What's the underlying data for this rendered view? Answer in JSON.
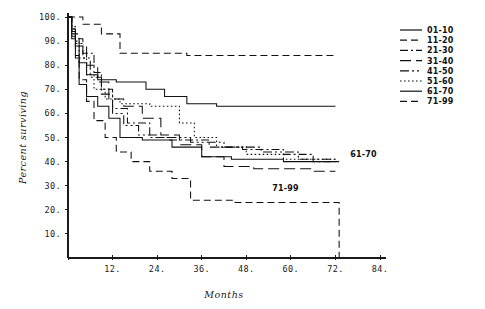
{
  "chart_data": {
    "type": "line",
    "title": "",
    "xlabel": "Months",
    "ylabel": "Percent surviving",
    "xlim": [
      0,
      84
    ],
    "ylim": [
      0,
      100
    ],
    "xticks": [
      0,
      12,
      24,
      36,
      48,
      60,
      72,
      84
    ],
    "xticklabels": [
      "",
      "12.",
      "24.",
      "36.",
      "48.",
      "60.",
      "72.",
      "84."
    ],
    "yticks": [
      10,
      20,
      30,
      40,
      50,
      60,
      70,
      80,
      90,
      100
    ],
    "yticklabels": [
      "10.",
      "20.",
      "30.",
      "40.",
      "50.",
      "60.",
      "70.",
      "80.",
      "90.",
      "100."
    ],
    "grid": false,
    "legend_position": "right",
    "series": [
      {
        "name": "01-10",
        "dash": "solid",
        "points": [
          [
            0,
            100
          ],
          [
            1,
            100
          ],
          [
            1,
            92
          ],
          [
            2,
            92
          ],
          [
            2,
            84
          ],
          [
            3,
            84
          ],
          [
            3,
            72
          ],
          [
            5,
            72
          ],
          [
            5,
            67
          ],
          [
            8,
            67
          ],
          [
            8,
            63
          ],
          [
            11,
            63
          ],
          [
            11,
            58
          ],
          [
            14,
            58
          ],
          [
            14,
            50
          ],
          [
            20,
            50
          ],
          [
            20,
            49
          ],
          [
            28,
            49
          ],
          [
            28,
            46
          ],
          [
            36,
            46
          ],
          [
            36,
            42
          ],
          [
            44,
            42
          ],
          [
            44,
            41
          ],
          [
            58,
            41
          ],
          [
            58,
            40
          ],
          [
            73,
            40
          ]
        ]
      },
      {
        "name": "11-20",
        "dash": "dashed",
        "points": [
          [
            0,
            100
          ],
          [
            4,
            100
          ],
          [
            4,
            97
          ],
          [
            9,
            97
          ],
          [
            9,
            93
          ],
          [
            14,
            93
          ],
          [
            14,
            85
          ],
          [
            32,
            85
          ],
          [
            32,
            84
          ],
          [
            72,
            84
          ]
        ]
      },
      {
        "name": "21-30",
        "dash": "dashdot",
        "points": [
          [
            0,
            100
          ],
          [
            1,
            100
          ],
          [
            1,
            94
          ],
          [
            2,
            94
          ],
          [
            2,
            91
          ],
          [
            4,
            91
          ],
          [
            4,
            85
          ],
          [
            7,
            85
          ],
          [
            7,
            77
          ],
          [
            9,
            77
          ],
          [
            9,
            70
          ],
          [
            12,
            70
          ],
          [
            12,
            62
          ],
          [
            16,
            62
          ],
          [
            16,
            56
          ],
          [
            22,
            56
          ],
          [
            22,
            50
          ],
          [
            27,
            50
          ],
          [
            27,
            49
          ],
          [
            38,
            49
          ],
          [
            38,
            46
          ],
          [
            47,
            46
          ],
          [
            47,
            45
          ],
          [
            58,
            45
          ],
          [
            58,
            43
          ],
          [
            66,
            43
          ],
          [
            66,
            40
          ],
          [
            72,
            40
          ]
        ]
      },
      {
        "name": "31-40",
        "dash": "longdash",
        "points": [
          [
            0,
            100
          ],
          [
            1,
            100
          ],
          [
            1,
            93
          ],
          [
            3,
            93
          ],
          [
            3,
            88
          ],
          [
            5,
            88
          ],
          [
            5,
            80
          ],
          [
            8,
            80
          ],
          [
            8,
            73
          ],
          [
            11,
            73
          ],
          [
            11,
            66
          ],
          [
            15,
            66
          ],
          [
            15,
            63
          ],
          [
            20,
            63
          ],
          [
            20,
            58
          ],
          [
            25,
            58
          ],
          [
            25,
            51
          ],
          [
            30,
            51
          ],
          [
            30,
            47
          ],
          [
            36,
            47
          ],
          [
            36,
            42
          ],
          [
            42,
            42
          ],
          [
            42,
            38
          ],
          [
            50,
            38
          ],
          [
            50,
            37
          ],
          [
            66,
            37
          ],
          [
            66,
            36
          ],
          [
            72,
            36
          ]
        ]
      },
      {
        "name": "41-50",
        "dash": "dashdotdot",
        "points": [
          [
            0,
            100
          ],
          [
            1,
            100
          ],
          [
            1,
            95
          ],
          [
            2,
            95
          ],
          [
            2,
            89
          ],
          [
            4,
            89
          ],
          [
            4,
            83
          ],
          [
            6,
            83
          ],
          [
            6,
            75
          ],
          [
            9,
            75
          ],
          [
            9,
            68
          ],
          [
            12,
            68
          ],
          [
            12,
            60
          ],
          [
            15,
            60
          ],
          [
            15,
            55
          ],
          [
            19,
            55
          ],
          [
            19,
            51
          ],
          [
            24,
            51
          ],
          [
            24,
            50
          ],
          [
            33,
            50
          ],
          [
            33,
            48
          ],
          [
            42,
            48
          ],
          [
            42,
            46
          ],
          [
            52,
            46
          ],
          [
            52,
            44
          ],
          [
            62,
            44
          ],
          [
            62,
            41
          ],
          [
            72,
            41
          ]
        ]
      },
      {
        "name": "51-60",
        "dash": "dotted",
        "points": [
          [
            0,
            100
          ],
          [
            1,
            100
          ],
          [
            1,
            96
          ],
          [
            2,
            96
          ],
          [
            2,
            90
          ],
          [
            3,
            90
          ],
          [
            3,
            83
          ],
          [
            5,
            83
          ],
          [
            5,
            76
          ],
          [
            7,
            76
          ],
          [
            7,
            70
          ],
          [
            10,
            70
          ],
          [
            10,
            66
          ],
          [
            14,
            66
          ],
          [
            14,
            64
          ],
          [
            22,
            64
          ],
          [
            22,
            63
          ],
          [
            30,
            63
          ],
          [
            30,
            56
          ],
          [
            34,
            56
          ],
          [
            34,
            50
          ],
          [
            40,
            50
          ],
          [
            40,
            46
          ],
          [
            48,
            46
          ],
          [
            48,
            43
          ],
          [
            58,
            43
          ],
          [
            58,
            41
          ],
          [
            72,
            41
          ]
        ]
      },
      {
        "name": "61-70",
        "dash": "solid",
        "points": [
          [
            0,
            100
          ],
          [
            1,
            100
          ],
          [
            1,
            95
          ],
          [
            2,
            95
          ],
          [
            2,
            88
          ],
          [
            3,
            88
          ],
          [
            3,
            81
          ],
          [
            5,
            81
          ],
          [
            5,
            76
          ],
          [
            8,
            76
          ],
          [
            8,
            74
          ],
          [
            13,
            74
          ],
          [
            13,
            73
          ],
          [
            21,
            73
          ],
          [
            21,
            70
          ],
          [
            26,
            70
          ],
          [
            26,
            67
          ],
          [
            32,
            67
          ],
          [
            32,
            64
          ],
          [
            40,
            64
          ],
          [
            40,
            63
          ],
          [
            72,
            63
          ]
        ]
      },
      {
        "name": "71-99",
        "dash": "dashed",
        "points": [
          [
            0,
            100
          ],
          [
            1,
            100
          ],
          [
            1,
            91
          ],
          [
            2,
            91
          ],
          [
            2,
            83
          ],
          [
            3,
            83
          ],
          [
            3,
            74
          ],
          [
            5,
            74
          ],
          [
            5,
            65
          ],
          [
            7,
            65
          ],
          [
            7,
            57
          ],
          [
            10,
            57
          ],
          [
            10,
            50
          ],
          [
            13,
            50
          ],
          [
            13,
            44
          ],
          [
            17,
            44
          ],
          [
            17,
            40
          ],
          [
            22,
            40
          ],
          [
            22,
            36
          ],
          [
            28,
            36
          ],
          [
            28,
            33
          ],
          [
            33,
            33
          ],
          [
            33,
            24
          ],
          [
            45,
            24
          ],
          [
            45,
            23
          ],
          [
            73,
            23
          ],
          [
            73,
            0
          ]
        ]
      }
    ],
    "annotations": [
      {
        "text": "61-70",
        "x": 76,
        "y": 43
      },
      {
        "text": "71-99",
        "x": 55,
        "y": 29
      }
    ]
  },
  "legend": {
    "entries": [
      {
        "label": "01-10",
        "dash": "solid"
      },
      {
        "label": "11-20",
        "dash": "dashed"
      },
      {
        "label": "21-30",
        "dash": "dashdot"
      },
      {
        "label": "31-40",
        "dash": "longdash"
      },
      {
        "label": "41-50",
        "dash": "dashdotdot"
      },
      {
        "label": "51-60",
        "dash": "dotted"
      },
      {
        "label": "61-70",
        "dash": "solid"
      },
      {
        "label": "71-99",
        "dash": "dashed"
      }
    ]
  }
}
